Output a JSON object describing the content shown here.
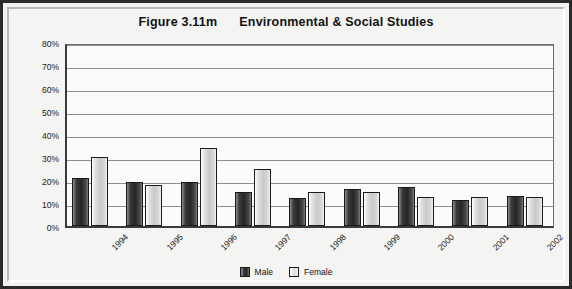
{
  "figure": {
    "title": "Figure 3.11m      Environmental & Social Studies",
    "frame_color": "#2b2b2b",
    "plot_background": "#fbfbfa"
  },
  "chart_data": {
    "type": "bar",
    "title": "Figure 3.11m      Environmental & Social Studies",
    "xlabel": "",
    "ylabel": "",
    "ylim": [
      0,
      80
    ],
    "grid": true,
    "legend_position": "bottom",
    "y_ticks": [
      "0%",
      "10%",
      "20%",
      "30%",
      "40%",
      "50%",
      "60%",
      "70%",
      "80%"
    ],
    "y_tick_values": [
      0,
      10,
      20,
      30,
      40,
      50,
      60,
      70,
      80
    ],
    "categories": [
      "1994",
      "1995",
      "1996",
      "1997",
      "1998",
      "1999",
      "2000",
      "2001",
      "2002"
    ],
    "series": [
      {
        "name": "Male",
        "color": "#2f2f2f",
        "values": [
          21,
          19,
          19,
          15,
          12,
          16,
          17,
          11.5,
          13
        ]
      },
      {
        "name": "Female",
        "color": "#d2d2d2",
        "values": [
          30,
          18,
          34,
          25,
          15,
          15,
          12.5,
          12.5,
          12.5
        ]
      }
    ]
  }
}
